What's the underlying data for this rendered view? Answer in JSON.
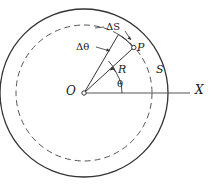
{
  "figure": {
    "background_color": "#ffffff",
    "stroke_color": "#333333",
    "labels": {
      "origin": "O",
      "axis": "X",
      "point": "P",
      "radius": "R",
      "circle": "S",
      "angle": "θ",
      "arc_increment": "ΔS",
      "angle_increment": "Δθ"
    }
  },
  "geometry": {
    "center": {
      "x": 84,
      "y": 93
    },
    "outer_circle": {
      "radius": 84,
      "style": "solid"
    },
    "inner_circle": {
      "radius": 68,
      "style": "dashed",
      "label": "S"
    },
    "point_P": {
      "x": 133,
      "y": 47
    },
    "theta_degrees": 43,
    "delta_theta_degrees": 13,
    "axis_end": {
      "x": 190,
      "y": 93
    }
  }
}
